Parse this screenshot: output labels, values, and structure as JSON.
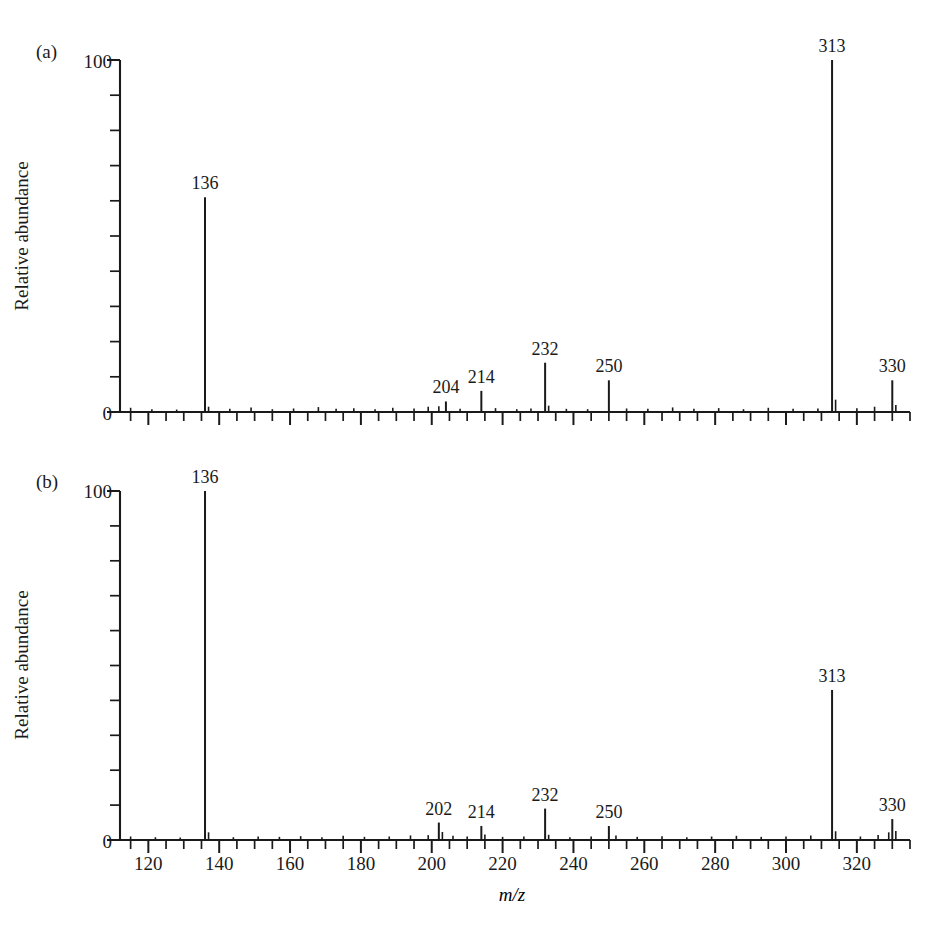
{
  "figure": {
    "title": "",
    "xlabel": "m/z",
    "ylabel": "Relative abundance",
    "panel_a_tag": "(a)",
    "panel_b_tag": "(b)",
    "y_tick_top": "100",
    "y_tick_bottom": "0"
  },
  "axis": {
    "x_tick_labels": [
      "120",
      "140",
      "160",
      "180",
      "200",
      "220",
      "240",
      "260",
      "280",
      "300",
      "320"
    ],
    "x_tick_values": [
      120,
      140,
      160,
      180,
      200,
      220,
      240,
      260,
      280,
      300,
      320
    ],
    "x_min": 112,
    "x_max": 335,
    "x_minor_step": 5,
    "y_min": 0,
    "y_max": 100,
    "y_minor_step": 10
  },
  "chart_data": [
    {
      "type": "bar",
      "name": "panel-a",
      "panel": "(a)",
      "title": "",
      "xlabel": "m/z",
      "ylabel": "Relative abundance",
      "xlim": [
        112,
        335
      ],
      "ylim": [
        0,
        100
      ],
      "grid": false,
      "legend": "none",
      "labeled_peaks": [
        {
          "mz": 136,
          "intensity": 61,
          "label": "136"
        },
        {
          "mz": 204,
          "intensity": 3,
          "label": "204"
        },
        {
          "mz": 214,
          "intensity": 6,
          "label": "214"
        },
        {
          "mz": 232,
          "intensity": 14,
          "label": "232"
        },
        {
          "mz": 250,
          "intensity": 9,
          "label": "250"
        },
        {
          "mz": 313,
          "intensity": 100,
          "label": "313"
        },
        {
          "mz": 330,
          "intensity": 9,
          "label": "330"
        }
      ],
      "minor_peaks": [
        {
          "mz": 115,
          "intensity": 1.2
        },
        {
          "mz": 121,
          "intensity": 0.8
        },
        {
          "mz": 128,
          "intensity": 0.7
        },
        {
          "mz": 137,
          "intensity": 1.5
        },
        {
          "mz": 143,
          "intensity": 0.9
        },
        {
          "mz": 149,
          "intensity": 1.3
        },
        {
          "mz": 155,
          "intensity": 0.8
        },
        {
          "mz": 161,
          "intensity": 1.0
        },
        {
          "mz": 168,
          "intensity": 1.4
        },
        {
          "mz": 173,
          "intensity": 0.9
        },
        {
          "mz": 178,
          "intensity": 1.1
        },
        {
          "mz": 184,
          "intensity": 0.8
        },
        {
          "mz": 189,
          "intensity": 1.2
        },
        {
          "mz": 195,
          "intensity": 1.0
        },
        {
          "mz": 199,
          "intensity": 1.5
        },
        {
          "mz": 202,
          "intensity": 1.6
        },
        {
          "mz": 208,
          "intensity": 0.9
        },
        {
          "mz": 218,
          "intensity": 1.1
        },
        {
          "mz": 224,
          "intensity": 0.8
        },
        {
          "mz": 228,
          "intensity": 1.0
        },
        {
          "mz": 233,
          "intensity": 1.8
        },
        {
          "mz": 238,
          "intensity": 0.9
        },
        {
          "mz": 244,
          "intensity": 0.8
        },
        {
          "mz": 255,
          "intensity": 1.0
        },
        {
          "mz": 261,
          "intensity": 0.9
        },
        {
          "mz": 268,
          "intensity": 1.3
        },
        {
          "mz": 274,
          "intensity": 0.9
        },
        {
          "mz": 281,
          "intensity": 1.1
        },
        {
          "mz": 288,
          "intensity": 0.8
        },
        {
          "mz": 295,
          "intensity": 1.2
        },
        {
          "mz": 302,
          "intensity": 0.9
        },
        {
          "mz": 309,
          "intensity": 1.0
        },
        {
          "mz": 314,
          "intensity": 3.5
        },
        {
          "mz": 320,
          "intensity": 1.1
        },
        {
          "mz": 325,
          "intensity": 1.5
        },
        {
          "mz": 331,
          "intensity": 2.0
        }
      ]
    },
    {
      "type": "bar",
      "name": "panel-b",
      "panel": "(b)",
      "title": "",
      "xlabel": "m/z",
      "ylabel": "Relative abundance",
      "xlim": [
        112,
        335
      ],
      "ylim": [
        0,
        100
      ],
      "grid": false,
      "legend": "none",
      "labeled_peaks": [
        {
          "mz": 136,
          "intensity": 100,
          "label": "136"
        },
        {
          "mz": 202,
          "intensity": 5,
          "label": "202"
        },
        {
          "mz": 214,
          "intensity": 4,
          "label": "214"
        },
        {
          "mz": 232,
          "intensity": 9,
          "label": "232"
        },
        {
          "mz": 250,
          "intensity": 4,
          "label": "250"
        },
        {
          "mz": 313,
          "intensity": 43,
          "label": "313"
        },
        {
          "mz": 330,
          "intensity": 6,
          "label": "330"
        }
      ],
      "minor_peaks": [
        {
          "mz": 115,
          "intensity": 1.0
        },
        {
          "mz": 122,
          "intensity": 0.8
        },
        {
          "mz": 129,
          "intensity": 0.7
        },
        {
          "mz": 137,
          "intensity": 2.2
        },
        {
          "mz": 144,
          "intensity": 0.8
        },
        {
          "mz": 151,
          "intensity": 1.0
        },
        {
          "mz": 157,
          "intensity": 0.9
        },
        {
          "mz": 163,
          "intensity": 1.1
        },
        {
          "mz": 169,
          "intensity": 0.8
        },
        {
          "mz": 175,
          "intensity": 1.2
        },
        {
          "mz": 181,
          "intensity": 0.9
        },
        {
          "mz": 188,
          "intensity": 1.0
        },
        {
          "mz": 194,
          "intensity": 1.3
        },
        {
          "mz": 199,
          "intensity": 1.4
        },
        {
          "mz": 203,
          "intensity": 2.3
        },
        {
          "mz": 206,
          "intensity": 1.2
        },
        {
          "mz": 210,
          "intensity": 1.0
        },
        {
          "mz": 215,
          "intensity": 1.6
        },
        {
          "mz": 220,
          "intensity": 0.9
        },
        {
          "mz": 226,
          "intensity": 1.0
        },
        {
          "mz": 233,
          "intensity": 1.5
        },
        {
          "mz": 239,
          "intensity": 0.8
        },
        {
          "mz": 245,
          "intensity": 1.0
        },
        {
          "mz": 252,
          "intensity": 1.3
        },
        {
          "mz": 258,
          "intensity": 0.9
        },
        {
          "mz": 265,
          "intensity": 1.1
        },
        {
          "mz": 272,
          "intensity": 0.8
        },
        {
          "mz": 279,
          "intensity": 1.0
        },
        {
          "mz": 286,
          "intensity": 1.2
        },
        {
          "mz": 293,
          "intensity": 0.9
        },
        {
          "mz": 300,
          "intensity": 1.0
        },
        {
          "mz": 307,
          "intensity": 1.3
        },
        {
          "mz": 314,
          "intensity": 2.5
        },
        {
          "mz": 321,
          "intensity": 1.0
        },
        {
          "mz": 326,
          "intensity": 1.4
        },
        {
          "mz": 329,
          "intensity": 2.2
        },
        {
          "mz": 331,
          "intensity": 2.6
        }
      ]
    }
  ],
  "colors": {
    "ink": "#1a1a1a",
    "background": "#ffffff"
  }
}
